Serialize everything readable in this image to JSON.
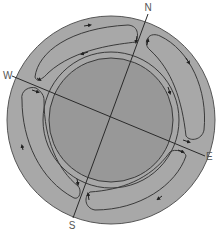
{
  "diagram": {
    "labels": {
      "north": "N",
      "south": "S",
      "east": "E",
      "west": "W"
    },
    "colors": {
      "outer_ring": "#a8a8a8",
      "inner_disk": "#989898",
      "lines": "#3a3a3a",
      "background": "#ffffff"
    },
    "cells": [
      {
        "name": "north-west-cell",
        "direction": "clockwise"
      },
      {
        "name": "north-east-cell",
        "direction": "clockwise"
      },
      {
        "name": "south-east-cell",
        "direction": "clockwise"
      },
      {
        "name": "south-west-cell",
        "direction": "clockwise"
      }
    ]
  }
}
